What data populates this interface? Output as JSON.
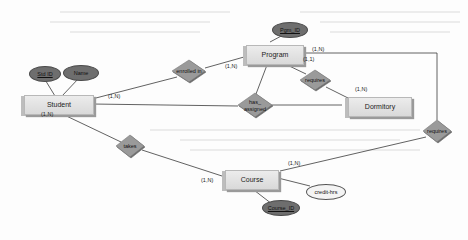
{
  "diagram": {
    "type": "ER diagram",
    "entities": [
      {
        "id": "student",
        "label": "Student"
      },
      {
        "id": "program",
        "label": "Program"
      },
      {
        "id": "dormitory",
        "label": "Dormitory"
      },
      {
        "id": "course",
        "label": "Course"
      }
    ],
    "attributes": [
      {
        "id": "std_id",
        "label": "Std ID",
        "key": true,
        "entity": "student"
      },
      {
        "id": "name",
        "label": "Name",
        "key": false,
        "entity": "student"
      },
      {
        "id": "pgm_id",
        "label": "Pgm_ID",
        "key": true,
        "entity": "program"
      },
      {
        "id": "course_id",
        "label": "Course_ID",
        "key": true,
        "entity": "course"
      },
      {
        "id": "credit_hrs",
        "label": "credit-hrs",
        "key": false,
        "entity": "course"
      }
    ],
    "relationships": [
      {
        "id": "enrolled_in",
        "label": "enrolled in"
      },
      {
        "id": "has_assigned",
        "label_line1": "has_",
        "label_line2": "assigned"
      },
      {
        "id": "requires_dorm",
        "label": "requires"
      },
      {
        "id": "takes",
        "label": "takes"
      },
      {
        "id": "requires_course",
        "label": "requires"
      }
    ],
    "cardinalities": {
      "student_enrolled": "(1,N)",
      "program_enrolled": "(1,N)",
      "program_requires_course": "(1,N)",
      "program_requires_dorm": "(1,1)",
      "dormitory_requires": "(1,N)",
      "student_takes": "(1,N)",
      "course_takes": "(1,N)",
      "course_requires": "(1,N)"
    }
  },
  "colors": {
    "entity_fill": "#dcdcdc",
    "relationship_fill": "#9a9a9a",
    "key_attribute_fill": "#6e6e6e",
    "line": "#3a3a3a"
  }
}
